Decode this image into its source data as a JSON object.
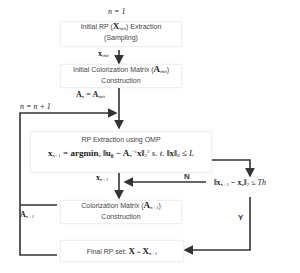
{
  "diagram": {
    "type": "flowchart",
    "line_color": "#333333",
    "nodes": {
      "init_rp": {
        "line1_prefix": "Initial RP (",
        "line1_var": "X",
        "line1_sub": "init",
        "line1_suffix": ") Extraction",
        "line2": "(Sampling)"
      },
      "init_matrix": {
        "line1_prefix": "Initial Colorization Matrix (",
        "line1_var": "A",
        "line1_sub": "init",
        "line1_suffix": ")",
        "line2": "Construction"
      },
      "omp": {
        "title": "RP Extraction using OMP",
        "formula_lhs": "x",
        "formula_lhs_sub": "n+1",
        "formula_eq": " = ",
        "formula_op": "argmin",
        "formula_op_sub": "x",
        "formula_body": "‖u₀ − A",
        "formula_body_sub": "n",
        "formula_body_sup": "−1",
        "formula_body_end": "x‖",
        "formula_norm_sub": "2",
        "formula_norm_sup": "2",
        "formula_st": " s. t. ",
        "formula_constraint": "‖x‖",
        "formula_constraint_sub": "0",
        "formula_constraint_end": " ≤ L"
      },
      "condition": {
        "prefix": "‖x",
        "sub1": "n+1",
        "mid": " − x",
        "sub2": "n",
        "end": "‖",
        "norm_sub": "2",
        "suffix": " ≤ Th"
      },
      "colorization": {
        "line1_prefix": "Colorization Matrix (",
        "line1_var": "A",
        "line1_sub": "n+1",
        "line1_suffix": ")",
        "line2": "Construction"
      },
      "final": {
        "prefix": "Final RP set: ",
        "var": "X",
        "eq": " = ",
        "rhs": "X",
        "rhs_sub": "n+1"
      }
    },
    "labels": {
      "n_init": "n = 1",
      "x_init_var": "x",
      "x_init_sub": "init",
      "a_n_eq_var": "A",
      "a_n_eq_sub": "n",
      "a_n_eq_mid": " = A",
      "a_n_eq_sub2": "init",
      "n_incr": "n = n + 1",
      "x_next_var": "x",
      "x_next_sub": "n+1",
      "a_next_var": "A",
      "a_next_sub": "n+1",
      "no": "N",
      "yes": "Y"
    }
  }
}
